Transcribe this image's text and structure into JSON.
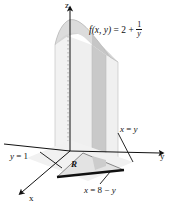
{
  "figure": {
    "background_color": "#ffffff",
    "line_color": "#111111",
    "surface_top_color": "#d8d8d8",
    "surface_side_light_color": "#ededed",
    "surface_side_dark_color": "#c9c9c9",
    "region_fill_color": "#e3e3e3",
    "region_fill_dark_color": "#cfcfcf"
  },
  "labels": {
    "function": {
      "prefix_f": "f",
      "args": "(x, y)",
      "equals": " = 2 + ",
      "fraction_numerator": "1",
      "fraction_denominator": "y",
      "full_text": "f(x, y) = 2 + 1/y"
    },
    "axis_z": "z",
    "axis_y": "y",
    "axis_x": "x",
    "line_x_equals_y": "x = y",
    "line_y_equals_1": "y = 1",
    "line_x_equals_8_minus_y": "x = 8 - y",
    "region": "R"
  },
  "label_parts": {
    "xy_line": {
      "var1": "x",
      "op": " = ",
      "var2": "y"
    },
    "y_eq_1": {
      "var1": "y",
      "op": " = ",
      "val": "1"
    },
    "x_eq_8_minus_y": {
      "var1": "x",
      "op1": " = ",
      "val": "8",
      "op2": " − ",
      "var2": "y"
    }
  }
}
